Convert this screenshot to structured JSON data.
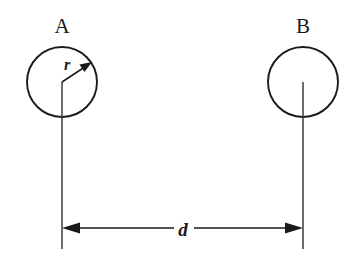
{
  "figure": {
    "background_color": "#ffffff",
    "stroke_color": "#1a1a1a",
    "line_color": "#3a3a3a",
    "width": 353,
    "height": 258
  },
  "labels": {
    "body_a": "A",
    "body_b": "B",
    "radius": "r",
    "distance": "d"
  },
  "geometry": {
    "circle_a": {
      "cx": 62,
      "cy": 82,
      "r": 35
    },
    "circle_b": {
      "cx": 303,
      "cy": 82,
      "r": 35
    },
    "radius_arrow": {
      "x1": 62,
      "y1": 82,
      "x2": 89,
      "y2": 63
    },
    "dimension_line": {
      "y": 228,
      "x1": 62,
      "x2": 303
    },
    "extension_line_left": {
      "x": 62,
      "y1": 82,
      "y2": 249
    },
    "extension_line_right": {
      "x": 303,
      "y1": 82,
      "y2": 249
    },
    "label_a_pos": {
      "x": 62,
      "y": 33
    },
    "label_b_pos": {
      "x": 303,
      "y": 33
    },
    "label_r_pos": {
      "x": 67,
      "y": 70
    },
    "label_d_pos": {
      "x": 183,
      "y": 236
    }
  }
}
